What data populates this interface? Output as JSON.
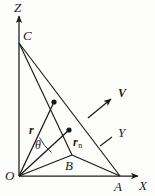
{
  "figure": {
    "background_color": "#fdfdfc",
    "line_color": "#1a1a1a",
    "labels": {
      "axis_z": "Z",
      "axis_x": "X",
      "axis_y": "Y",
      "point_o": "O",
      "point_a": "A",
      "point_b": "B",
      "point_c": "C",
      "vector_r": "r",
      "vector_rn_base": "r",
      "vector_rn_sub": "n",
      "vector_v": "V",
      "angle_theta": "θ"
    },
    "geometry": {
      "origin": [
        19,
        176
      ],
      "x_axis_end": [
        140,
        176
      ],
      "z_axis_end": [
        19,
        15
      ],
      "point_a": [
        120,
        176
      ],
      "point_b": [
        72,
        155
      ],
      "point_c": [
        19,
        43
      ],
      "r_tip": [
        54,
        102
      ],
      "rn_tip": [
        69,
        130
      ],
      "v_tail": [
        88,
        118
      ],
      "v_head": [
        113,
        97
      ],
      "y_leader_tail": [
        112,
        138
      ],
      "y_leader_head": [
        101,
        145
      ]
    }
  }
}
